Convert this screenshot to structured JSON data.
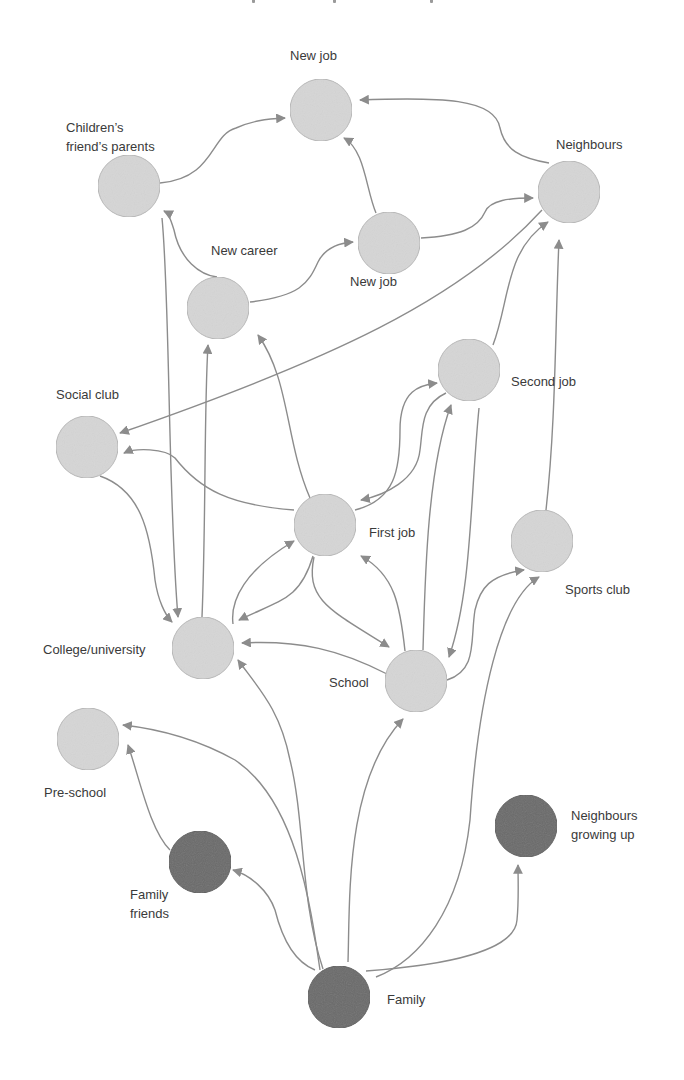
{
  "colors": {
    "background": "#ffffff",
    "node_light_fill": "#d6d6d6",
    "node_light_stroke": "#b8b8b8",
    "node_dark_fill": "#6b6b6b",
    "node_dark_stroke": "#5e5e5e",
    "edge": "#8c8c8c",
    "label": "#3a3a3a"
  },
  "node_radius": 31,
  "nodes": [
    {
      "id": "new-job-top",
      "label": "New job",
      "x": 321,
      "y": 110,
      "kind": "light",
      "label_x": 290,
      "label_y": 46
    },
    {
      "id": "childrens-friends-parents",
      "label": "Children’s\nfriend’s parents",
      "x": 129,
      "y": 186,
      "kind": "light",
      "label_x": 66,
      "label_y": 118
    },
    {
      "id": "neighbours",
      "label": "Neighbours",
      "x": 569,
      "y": 192,
      "kind": "light",
      "label_x": 556,
      "label_y": 135
    },
    {
      "id": "new-job-mid",
      "label": "New job",
      "x": 389,
      "y": 243,
      "kind": "light",
      "label_x": 350,
      "label_y": 272
    },
    {
      "id": "new-career",
      "label": "New career",
      "x": 218,
      "y": 308,
      "kind": "light",
      "label_x": 211,
      "label_y": 241
    },
    {
      "id": "second-job",
      "label": "Second job",
      "x": 469,
      "y": 370,
      "kind": "light",
      "label_x": 511,
      "label_y": 372
    },
    {
      "id": "social-club",
      "label": "Social club",
      "x": 87,
      "y": 447,
      "kind": "light",
      "label_x": 56,
      "label_y": 385
    },
    {
      "id": "first-job",
      "label": "First job",
      "x": 325,
      "y": 525,
      "kind": "light",
      "label_x": 369,
      "label_y": 523
    },
    {
      "id": "sports-club",
      "label": "Sports club",
      "x": 542,
      "y": 541,
      "kind": "light",
      "label_x": 565,
      "label_y": 580
    },
    {
      "id": "college-university",
      "label": "College/university",
      "x": 203,
      "y": 648,
      "kind": "light",
      "label_x": 43,
      "label_y": 640
    },
    {
      "id": "school",
      "label": "School",
      "x": 416,
      "y": 681,
      "kind": "light",
      "label_x": 329,
      "label_y": 673
    },
    {
      "id": "pre-school",
      "label": "Pre-school",
      "x": 88,
      "y": 739,
      "kind": "light",
      "label_x": 44,
      "label_y": 783
    },
    {
      "id": "family-friends",
      "label": "Family\nfriends",
      "x": 200,
      "y": 862,
      "kind": "dark",
      "label_x": 130,
      "label_y": 885
    },
    {
      "id": "neighbours-growing-up",
      "label": "Neighbours\ngrowing up",
      "x": 526,
      "y": 826,
      "kind": "dark",
      "label_x": 571,
      "label_y": 806
    },
    {
      "id": "family",
      "label": "Family",
      "x": 339,
      "y": 997,
      "kind": "dark",
      "label_x": 387,
      "label_y": 990
    }
  ],
  "edges": [
    {
      "from": "childrens-friends-parents",
      "to": "new-job-top",
      "d": "M160,183 C215,178 210,135 236,128 C252,121 265,119 285,118"
    },
    {
      "from": "new-job-mid",
      "to": "new-job-top",
      "d": "M376,213 C366,190 365,150 344,138"
    },
    {
      "from": "neighbours",
      "to": "new-job-top",
      "d": "M549,163 C520,158 505,150 500,128 C495,98 440,97 360,100"
    },
    {
      "from": "new-job-mid",
      "to": "neighbours",
      "d": "M421,238 C460,236 478,228 485,212 C490,200 510,198 533,198"
    },
    {
      "from": "new-career",
      "to": "new-job-mid",
      "d": "M250,302 C300,296 308,284 318,262 C325,248 340,243 353,242"
    },
    {
      "from": "new-career",
      "to": "childrens-friends-parents",
      "d": "M217,277 C200,275 180,260 174,230 C170,217 168,213 164,211"
    },
    {
      "from": "childrens-friends-parents",
      "to": "college-university",
      "d": "M162,218 C170,300 168,500 178,617"
    },
    {
      "from": "college-university",
      "to": "new-career",
      "d": "M202,617 C206,520 204,410 208,345"
    },
    {
      "from": "first-job",
      "to": "new-career",
      "d": "M310,498 C285,440 290,380 258,335"
    },
    {
      "from": "second-job",
      "to": "neighbours",
      "d": "M493,345 C510,300 505,250 548,222"
    },
    {
      "from": "neighbours",
      "to": "social-club",
      "d": "M542,210 C460,300 330,360 120,433"
    },
    {
      "from": "first-job",
      "to": "social-club",
      "d": "M294,510 C230,505 200,490 175,458 C165,448 135,448 124,453"
    },
    {
      "from": "social-club",
      "to": "college-university",
      "d": "M100,476 C140,490 150,530 155,580 C158,600 165,615 172,622"
    },
    {
      "from": "first-job",
      "to": "second-job",
      "d": "M355,510 C395,500 400,470 400,430 C400,390 420,385 437,383"
    },
    {
      "from": "second-job",
      "to": "first-job",
      "d": "M446,393 C420,405 423,430 420,450 C417,480 385,495 361,500"
    },
    {
      "from": "school",
      "to": "second-job",
      "d": "M423,650 C425,580 427,470 451,405"
    },
    {
      "from": "second-job",
      "to": "school",
      "d": "M479,408 C470,500 472,590 449,657"
    },
    {
      "from": "sports-club",
      "to": "neighbours",
      "d": "M546,510 C556,420 555,330 559,240"
    },
    {
      "from": "school",
      "to": "sports-club",
      "d": "M447,680 C478,670 470,640 475,610 C480,588 490,575 524,570"
    },
    {
      "from": "family",
      "to": "sports-club",
      "d": "M376,977 C420,960 460,910 470,820 C478,700 500,600 539,577"
    },
    {
      "from": "college-university",
      "to": "first-job",
      "d": "M233,624 C230,600 245,570 294,541"
    },
    {
      "from": "first-job",
      "to": "college-university",
      "d": "M313,556 C300,600 280,600 239,620"
    },
    {
      "from": "school",
      "to": "college-university",
      "d": "M387,674 C340,650 300,640 242,643"
    },
    {
      "from": "first-job",
      "to": "school",
      "d": "M314,557 C305,600 330,610 389,647"
    },
    {
      "from": "school",
      "to": "first-job",
      "d": "M405,651 C400,605 395,575 361,556"
    },
    {
      "from": "family",
      "to": "college-university",
      "d": "M323,969 C300,900 305,820 290,760 C280,710 260,690 238,660"
    },
    {
      "from": "family",
      "to": "pre-school",
      "d": "M320,970 C310,900 295,800 235,760 C190,735 150,728 123,725"
    },
    {
      "from": "family-friends",
      "to": "pre-school",
      "d": "M170,850 C150,830 140,780 128,745"
    },
    {
      "from": "family",
      "to": "family-friends",
      "d": "M315,970 C290,960 280,930 275,910 C268,890 250,875 233,870"
    },
    {
      "from": "family",
      "to": "school",
      "d": "M348,962 C350,900 345,780 403,719"
    },
    {
      "from": "family",
      "to": "neighbours-growing-up",
      "d": "M366,971 C450,965 515,950 517,920 C519,900 518,880 518,865"
    }
  ],
  "header_fragment": {
    "visible": true
  }
}
